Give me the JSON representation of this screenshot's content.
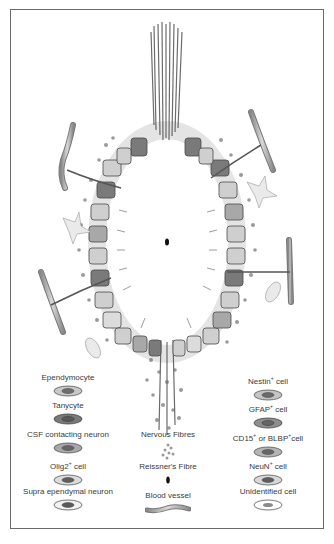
{
  "figure": {
    "central_canal_marker": "Reissner's Fibre"
  },
  "legend": {
    "left": [
      {
        "label": "Ependymocyte",
        "fill": "#c8c8c8",
        "nucleus": "#6e6e6e"
      },
      {
        "label": "Tanycyte",
        "fill": "#7a7a7a",
        "nucleus": "#5a5a5a"
      },
      {
        "label": "CSF contacting neuron",
        "fill": "#a8a8a8",
        "nucleus": "#666666"
      },
      {
        "label": "Olig2",
        "sup": "+",
        "suffix": " cell",
        "fill": "#dcdcdc",
        "nucleus": "#5e5e5e"
      },
      {
        "label": "Supra ependymal neuron",
        "fill": "#f2f2f2",
        "nucleus": "#5a5a5a"
      }
    ],
    "center": [
      {
        "label": "Nervous Fibres",
        "icon": "dots"
      },
      {
        "label": "Reissner's Fibre",
        "icon": "black-oval"
      },
      {
        "label": "Blood vessel",
        "icon": "vessel"
      }
    ],
    "right": [
      {
        "label": "Nestin",
        "sup": "+",
        "suffix": " cell",
        "fill": "#c4c4c4",
        "nucleus": "#6a6a6a"
      },
      {
        "label": "GFAP",
        "sup": "+",
        "suffix": " cell",
        "fill": "#8e8e8e",
        "nucleus": "#666666"
      },
      {
        "label": "CD15",
        "sup": "+",
        "mid": " or BLBP",
        "sup2": "+",
        "suffix": "cell",
        "fill": "#b4b4b4",
        "nucleus": "#666666"
      },
      {
        "label": "NeuN",
        "sup": "+",
        "suffix": " cell",
        "fill": "#d8d8d8",
        "nucleus": "#5e5e5e"
      },
      {
        "label": "Unidentified cell",
        "fill": "#ffffff",
        "nucleus": "#8a8a8a"
      }
    ]
  },
  "colors": {
    "border": "#6a6a6a",
    "text": "#3a3a3a",
    "cell_light": "#cfcfcf",
    "cell_dark": "#7a7a7a",
    "vessel": "#b0b0b0"
  }
}
